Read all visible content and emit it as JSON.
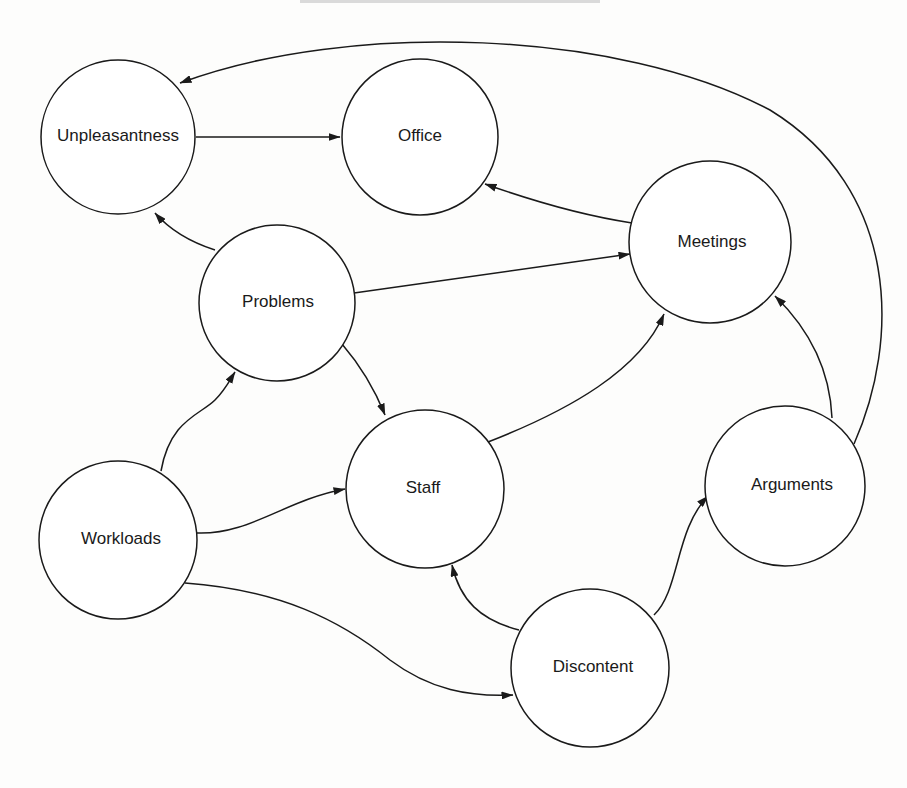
{
  "diagram": {
    "type": "directed-graph",
    "nodes": [
      {
        "id": "unpleasantness",
        "label": "Unpleasantness",
        "cx": 118,
        "cy": 137,
        "r": 77
      },
      {
        "id": "office",
        "label": "Office",
        "cx": 420,
        "cy": 137,
        "r": 78
      },
      {
        "id": "meetings",
        "label": "Meetings",
        "cx": 710,
        "cy": 242,
        "r": 81
      },
      {
        "id": "problems",
        "label": "Problems",
        "cx": 277,
        "cy": 303,
        "r": 78
      },
      {
        "id": "staff",
        "label": "Staff",
        "cx": 425,
        "cy": 489,
        "r": 79
      },
      {
        "id": "workloads",
        "label": "Workloads",
        "cx": 118,
        "cy": 540,
        "r": 79
      },
      {
        "id": "arguments",
        "label": "Arguments",
        "cx": 785,
        "cy": 486,
        "r": 80
      },
      {
        "id": "discontent",
        "label": "Discontent",
        "cx": 590,
        "cy": 668,
        "r": 79
      }
    ],
    "edges": [
      {
        "from": "unpleasantness",
        "to": "office"
      },
      {
        "from": "arguments",
        "to": "unpleasantness"
      },
      {
        "from": "meetings",
        "to": "office"
      },
      {
        "from": "problems",
        "to": "unpleasantness"
      },
      {
        "from": "problems",
        "to": "meetings"
      },
      {
        "from": "problems",
        "to": "staff"
      },
      {
        "from": "workloads",
        "to": "problems"
      },
      {
        "from": "workloads",
        "to": "staff"
      },
      {
        "from": "workloads",
        "to": "discontent"
      },
      {
        "from": "staff",
        "to": "meetings"
      },
      {
        "from": "arguments",
        "to": "meetings"
      },
      {
        "from": "discontent",
        "to": "staff"
      },
      {
        "from": "discontent",
        "to": "arguments"
      }
    ]
  },
  "colors": {
    "stroke": "#1a1a1a",
    "background": "#fdfdfc",
    "node_fill": "#ffffff"
  }
}
